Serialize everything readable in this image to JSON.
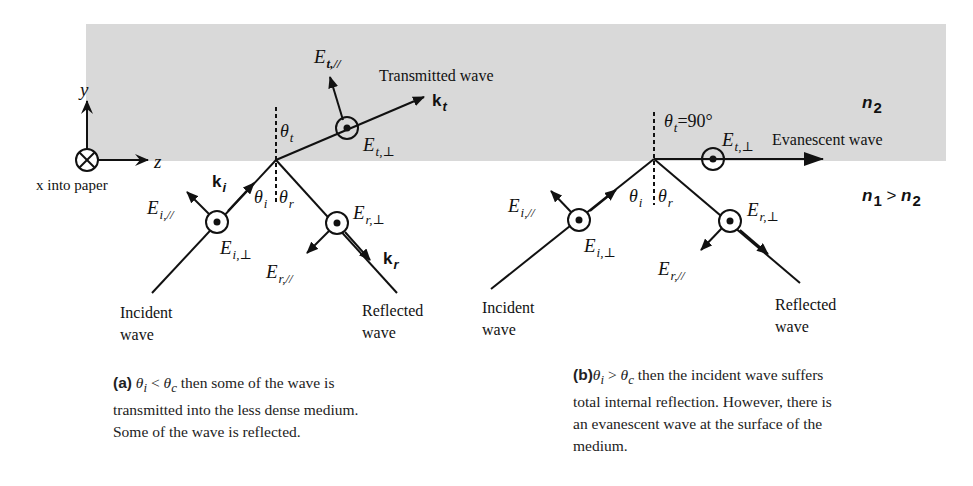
{
  "figure": {
    "medium_top": {
      "label": "n",
      "sub": "2",
      "fill": "#d9d9d9"
    },
    "medium_bottom": {
      "label": "n",
      "sub1": "1",
      "rel": " > ",
      "label2": "n",
      "sub2": "2"
    },
    "axes": {
      "y_label": "y",
      "z_label": "z",
      "x_note": "x into paper"
    }
  },
  "panel_a": {
    "transmitted_label": "Transmitted wave",
    "k_t": {
      "k": "k",
      "sub": "t"
    },
    "k_i": {
      "k": "k",
      "sub": "i"
    },
    "k_r": {
      "k": "k",
      "sub": "r"
    },
    "E_t_par": {
      "E": "E",
      "sub": "t,//"
    },
    "E_t_perp": {
      "E": "E",
      "sub": "t,⊥"
    },
    "E_i_par": {
      "E": "E",
      "sub": "i,//"
    },
    "E_i_perp": {
      "E": "E",
      "sub": "i,⊥"
    },
    "E_r_par": {
      "E": "E",
      "sub": "r,//"
    },
    "E_r_perp": {
      "E": "E",
      "sub": "r,⊥"
    },
    "theta_t": {
      "t": "θ",
      "sub": "t"
    },
    "theta_i": {
      "t": "θ",
      "sub": "i"
    },
    "theta_r": {
      "t": "θ",
      "sub": "r"
    },
    "incident_label": [
      "Incident",
      "wave"
    ],
    "reflected_label": [
      "Reflected",
      "wave"
    ],
    "caption": {
      "tag": "(a)",
      "cond": {
        "t1": "θ",
        "s1": "i",
        "op": " < ",
        "t2": "θ",
        "s2": "c"
      },
      "lines": [
        " then some of the wave is",
        "transmitted into the less dense medium.",
        "Some of the wave is reflected."
      ]
    }
  },
  "panel_b": {
    "evanescent_label": "Evanescent wave",
    "theta_t_eq": {
      "t": "θ",
      "sub": "t",
      "val": "=90°"
    },
    "E_t_perp": {
      "E": "E",
      "sub": "t,⊥"
    },
    "E_i_par": {
      "E": "E",
      "sub": "i,//"
    },
    "E_i_perp": {
      "E": "E",
      "sub": "i,⊥"
    },
    "E_r_par": {
      "E": "E",
      "sub": "r,//"
    },
    "E_r_perp": {
      "E": "E",
      "sub": "r,⊥"
    },
    "theta_i": {
      "t": "θ",
      "sub": "i"
    },
    "theta_r": {
      "t": "θ",
      "sub": "r"
    },
    "incident_label": [
      "Incident",
      "wave"
    ],
    "reflected_label": [
      "Reflected",
      "wave"
    ],
    "caption": {
      "tag": "(b)",
      "cond": {
        "t1": "θ",
        "s1": "i",
        "op": " > ",
        "t2": "θ",
        "s2": "c"
      },
      "lines": [
        " then the incident wave suffers",
        "total internal reflection. However, there is",
        "an evanescent wave at the surface of the",
        "medium."
      ]
    }
  }
}
